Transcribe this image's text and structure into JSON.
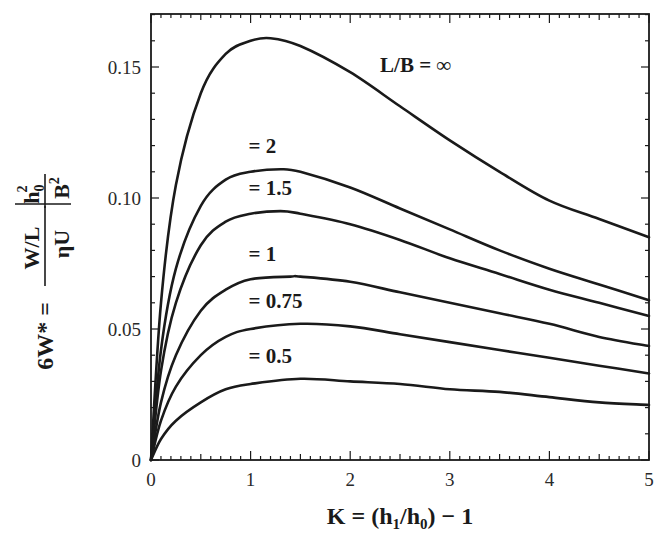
{
  "chart_data": {
    "type": "line",
    "title": "",
    "xlabel": "K = (h1/h0) − 1",
    "ylabel": "6W* = (W/L)/(ηU) · h0²/B²",
    "xlim": [
      0,
      5
    ],
    "ylim": [
      0,
      0.17
    ],
    "xticks": [
      0,
      1,
      2,
      3,
      4,
      5
    ],
    "xtick_labels": [
      "0",
      "1",
      "2",
      "3",
      "4",
      "5"
    ],
    "yticks": [
      0,
      0.05,
      0.1,
      0.15
    ],
    "ytick_labels": [
      "0",
      "0.05",
      "0.10",
      "0.15"
    ],
    "grid": false,
    "legend": "inline labels",
    "series": [
      {
        "name": "L/B = ∞",
        "label": "L/B = ∞",
        "x": [
          0,
          0.1,
          0.25,
          0.5,
          0.75,
          1.0,
          1.2,
          1.5,
          2.0,
          2.5,
          3.0,
          3.5,
          4.0,
          4.5,
          5.0
        ],
        "values": [
          0,
          0.06,
          0.105,
          0.14,
          0.155,
          0.16,
          0.161,
          0.158,
          0.148,
          0.135,
          0.122,
          0.11,
          0.099,
          0.092,
          0.085
        ]
      },
      {
        "name": "L/B = 2",
        "label": "= 2",
        "x": [
          0,
          0.1,
          0.25,
          0.5,
          0.75,
          1.0,
          1.3,
          1.5,
          2.0,
          2.5,
          3.0,
          3.5,
          4.0,
          4.5,
          5.0
        ],
        "values": [
          0,
          0.042,
          0.073,
          0.097,
          0.107,
          0.11,
          0.111,
          0.11,
          0.104,
          0.096,
          0.088,
          0.08,
          0.073,
          0.067,
          0.061
        ]
      },
      {
        "name": "L/B = 1.5",
        "label": "= 1.5",
        "x": [
          0,
          0.1,
          0.25,
          0.5,
          0.75,
          1.0,
          1.3,
          1.5,
          2.0,
          2.5,
          3.0,
          3.5,
          4.0,
          4.5,
          5.0
        ],
        "values": [
          0,
          0.034,
          0.06,
          0.082,
          0.091,
          0.094,
          0.095,
          0.094,
          0.09,
          0.084,
          0.077,
          0.071,
          0.065,
          0.06,
          0.055
        ]
      },
      {
        "name": "L/B = 1",
        "label": "= 1",
        "x": [
          0,
          0.1,
          0.25,
          0.5,
          0.75,
          1.0,
          1.4,
          1.5,
          2.0,
          2.5,
          3.0,
          3.5,
          4.0,
          4.5,
          5.0
        ],
        "values": [
          0,
          0.022,
          0.04,
          0.057,
          0.065,
          0.069,
          0.07,
          0.07,
          0.068,
          0.064,
          0.06,
          0.056,
          0.052,
          0.047,
          0.0435
        ]
      },
      {
        "name": "L/B = 0.75",
        "label": "= 0.75",
        "x": [
          0,
          0.1,
          0.25,
          0.5,
          0.75,
          1.0,
          1.5,
          2.0,
          2.5,
          3.0,
          3.5,
          4.0,
          4.5,
          5.0
        ],
        "values": [
          0,
          0.015,
          0.028,
          0.04,
          0.047,
          0.05,
          0.052,
          0.051,
          0.048,
          0.045,
          0.042,
          0.039,
          0.036,
          0.033
        ]
      },
      {
        "name": "L/B = 0.5",
        "label": "= 0.5",
        "x": [
          0,
          0.1,
          0.25,
          0.5,
          0.75,
          1.0,
          1.5,
          2.0,
          2.5,
          3.0,
          3.5,
          4.0,
          4.5,
          5.0
        ],
        "values": [
          0,
          0.008,
          0.015,
          0.022,
          0.027,
          0.029,
          0.031,
          0.03,
          0.029,
          0.027,
          0.026,
          0.024,
          0.022,
          0.021
        ]
      }
    ],
    "annotations": [
      {
        "text": "L/B = ∞",
        "x": 2.3,
        "y": 0.148
      },
      {
        "text": "= 2",
        "x": 0.98,
        "y": 0.117
      },
      {
        "text": "= 1.5",
        "x": 0.98,
        "y": 0.101
      },
      {
        "text": "= 1",
        "x": 0.98,
        "y": 0.076
      },
      {
        "text": "= 0.75",
        "x": 0.98,
        "y": 0.058
      },
      {
        "text": "= 0.5",
        "x": 0.98,
        "y": 0.037
      }
    ]
  },
  "axis_text": {
    "x_title_main": "K = (h",
    "x_title_sub1": "1",
    "x_title_mid": "/h",
    "x_title_sub0": "0",
    "x_title_end": ") − 1",
    "y_title_lhs": "6W* =",
    "y_title_num": "W/L",
    "y_title_den": "ηU",
    "y_title_h": "h",
    "y_title_h_sub": "0",
    "y_title_h_sup": "2",
    "y_title_B": "B",
    "y_title_B_sup": "2"
  }
}
